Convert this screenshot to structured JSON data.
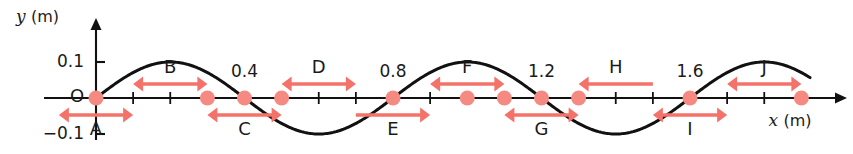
{
  "figure": {
    "type": "wave-snapshot-diagram",
    "axes": {
      "x_axis": {
        "label": "x",
        "unit": "(m)",
        "label_full": "x (m)"
      },
      "y_axis": {
        "label": "y",
        "unit": "(m)",
        "label_full": "y (m)"
      },
      "origin_label": "O",
      "y_ticks": [
        {
          "value": 0.1,
          "text": "0.1"
        },
        {
          "value": -0.1,
          "text": "−0.1"
        }
      ],
      "x_ticks_labeled": [
        {
          "value": 0.4,
          "text": "0.4"
        },
        {
          "value": 0.8,
          "text": "0.8"
        },
        {
          "value": 1.2,
          "text": "1.2"
        },
        {
          "value": 1.6,
          "text": "1.6"
        }
      ],
      "x_tick_interval": 0.1,
      "x_range": [
        -0.1,
        2.0
      ],
      "y_range": [
        -0.13,
        0.13
      ]
    },
    "wave": {
      "amplitude": 0.1,
      "wavelength": 0.8,
      "equation": "y = 0.1 sin(2πx/0.8)",
      "color": "#111111"
    },
    "markers": {
      "color": "#f4867f",
      "x_values": [
        0.0,
        0.3,
        0.4,
        0.5,
        0.8,
        1.0,
        1.1,
        1.2,
        1.3,
        1.6,
        1.9
      ]
    },
    "arrows": [
      {
        "id": "A",
        "label": "A",
        "x_start": -0.1,
        "x_end": 0.1,
        "side": "below",
        "heads": "both"
      },
      {
        "id": "B",
        "label": "B",
        "x_start": 0.1,
        "x_end": 0.3,
        "side": "above",
        "heads": "both"
      },
      {
        "id": "C",
        "label": "C",
        "x_start": 0.3,
        "x_end": 0.5,
        "side": "below",
        "heads": "both"
      },
      {
        "id": "D",
        "label": "D",
        "x_start": 0.5,
        "x_end": 0.7,
        "side": "above",
        "heads": "both"
      },
      {
        "id": "E",
        "label": "E",
        "x_start": 0.7,
        "x_end": 0.9,
        "side": "below",
        "heads": "right"
      },
      {
        "id": "F",
        "label": "F",
        "x_start": 0.9,
        "x_end": 1.1,
        "side": "above",
        "heads": "both"
      },
      {
        "id": "G",
        "label": "G",
        "x_start": 1.1,
        "x_end": 1.3,
        "side": "below",
        "heads": "both"
      },
      {
        "id": "H",
        "label": "H",
        "x_start": 1.3,
        "x_end": 1.5,
        "side": "above",
        "heads": "left"
      },
      {
        "id": "I",
        "label": "I",
        "x_start": 1.5,
        "x_end": 1.7,
        "side": "below",
        "heads": "both"
      },
      {
        "id": "J",
        "label": "J",
        "x_start": 1.7,
        "x_end": 1.9,
        "side": "above",
        "heads": "both"
      }
    ],
    "colors": {
      "arrow": "#f4726a",
      "marker": "#f58a83",
      "curve": "#111111",
      "axis": "#111111",
      "text": "#1a1a1a",
      "background": "#ffffff"
    }
  }
}
